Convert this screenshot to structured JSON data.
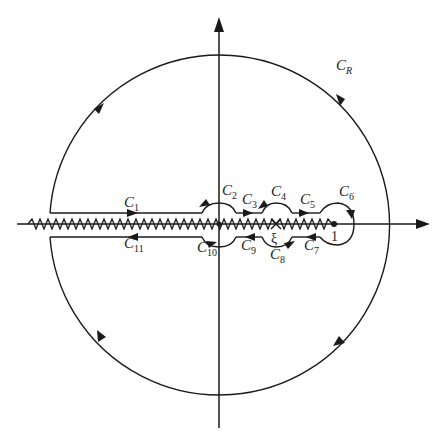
{
  "figure": {
    "origin": {
      "x": 219,
      "y": 225
    },
    "big_circle": {
      "label": "C",
      "subscript": "R",
      "radius": 170
    },
    "points": {
      "xi": {
        "label": "ξ",
        "x": 276
      },
      "one": {
        "label": "1",
        "x": 334
      }
    },
    "contours": [
      {
        "id": "C1",
        "label": "C",
        "sub": "1"
      },
      {
        "id": "C2",
        "label": "C",
        "sub": "2"
      },
      {
        "id": "C3",
        "label": "C",
        "sub": "3"
      },
      {
        "id": "C4",
        "label": "C",
        "sub": "4"
      },
      {
        "id": "C5",
        "label": "C",
        "sub": "5"
      },
      {
        "id": "C6",
        "label": "C",
        "sub": "6"
      },
      {
        "id": "C7",
        "label": "C",
        "sub": "7"
      },
      {
        "id": "C8",
        "label": "C",
        "sub": "8"
      },
      {
        "id": "C9",
        "label": "C",
        "sub": "9"
      },
      {
        "id": "C10",
        "label": "C",
        "sub": "10"
      },
      {
        "id": "C11",
        "label": "C",
        "sub": "11"
      }
    ],
    "stroke_color": "#1a1a1a",
    "background": "#ffffff"
  }
}
